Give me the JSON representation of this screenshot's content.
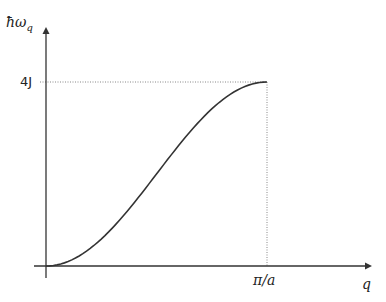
{
  "chart_data": {
    "type": "line",
    "title": "",
    "xlabel": "q",
    "ylabel": "ħω_q",
    "ylabel_main": "ħω",
    "ylabel_sub": "q",
    "x_ticks": [
      {
        "value": 3.14159,
        "label": "π/a"
      }
    ],
    "y_ticks": [
      {
        "value": 4,
        "label": "4J"
      }
    ],
    "xlim": [
      0,
      3.45
    ],
    "ylim": [
      0,
      4.9
    ],
    "grid": false,
    "legend": null,
    "series": [
      {
        "name": "dispersion 4J·sin²(qa/2)",
        "x": [
          0,
          0.314,
          0.628,
          0.942,
          1.257,
          1.571,
          1.885,
          2.199,
          2.513,
          2.827,
          3.142
        ],
        "y": [
          0,
          0.098,
          0.382,
          0.824,
          1.382,
          2.0,
          2.618,
          3.176,
          3.618,
          3.902,
          4.0
        ],
        "color": "#333333"
      }
    ],
    "annotations": [
      {
        "type": "dotted-hline",
        "y": 4,
        "label": "4J"
      },
      {
        "type": "dotted-vline",
        "x": 3.14159,
        "label": "π/a"
      }
    ]
  }
}
